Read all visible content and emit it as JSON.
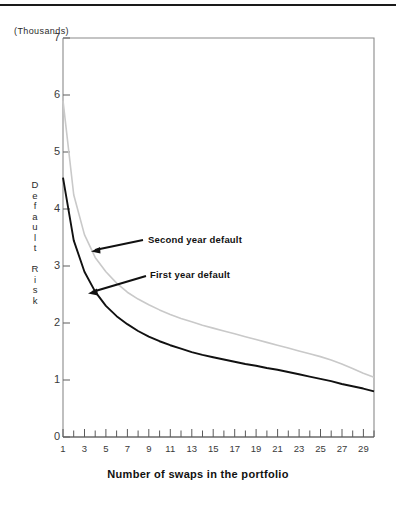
{
  "figure": {
    "units_note": "(Thousands)",
    "ylabel_text": "D\ne\nf\na\nu\nl\nt\n\nR\ni\ns\nk",
    "xlabel_text": "Number of swaps in the portfolio",
    "series_black_color": "#111111",
    "series_gray_color": "#c9c9c9",
    "frame_color": "#8a8a8a"
  },
  "annotations": {
    "second_year": "Second year default",
    "first_year": "First year default"
  },
  "axis": {
    "y_ticks": [
      "0",
      "1",
      "2",
      "3",
      "4",
      "5",
      "6",
      "7"
    ],
    "x_ticks": [
      "1",
      "3",
      "5",
      "7",
      "9",
      "11",
      "13",
      "15",
      "17",
      "19",
      "21",
      "23",
      "25",
      "27",
      "29"
    ]
  },
  "chart_data": {
    "type": "line",
    "title": "",
    "subtitle": "",
    "xlabel": "Number of swaps in the portfolio",
    "ylabel": "Default Risk",
    "units": "(Thousands)",
    "xlim": [
      1,
      30
    ],
    "ylim": [
      0,
      7
    ],
    "grid": false,
    "legend": "inline-annotations",
    "x": [
      1,
      2,
      3,
      4,
      5,
      6,
      7,
      8,
      9,
      10,
      11,
      12,
      13,
      14,
      15,
      16,
      17,
      18,
      19,
      20,
      21,
      22,
      23,
      24,
      25,
      26,
      27,
      28,
      29,
      30
    ],
    "series": [
      {
        "name": "First year default",
        "color": "#111111",
        "style": "solid",
        "values": [
          4.55,
          3.45,
          2.9,
          2.55,
          2.3,
          2.12,
          1.98,
          1.86,
          1.76,
          1.68,
          1.61,
          1.55,
          1.49,
          1.44,
          1.4,
          1.36,
          1.32,
          1.28,
          1.25,
          1.21,
          1.18,
          1.14,
          1.1,
          1.06,
          1.02,
          0.98,
          0.93,
          0.89,
          0.85,
          0.8
        ]
      },
      {
        "name": "Second year default",
        "color": "#c9c9c9",
        "style": "solid",
        "values": [
          5.9,
          4.25,
          3.55,
          3.15,
          2.9,
          2.7,
          2.54,
          2.42,
          2.32,
          2.23,
          2.15,
          2.08,
          2.02,
          1.96,
          1.91,
          1.86,
          1.81,
          1.76,
          1.71,
          1.66,
          1.61,
          1.56,
          1.51,
          1.46,
          1.41,
          1.35,
          1.28,
          1.2,
          1.12,
          1.05
        ]
      }
    ],
    "annotations": [
      {
        "text": "Second year default",
        "points_to_series": "Second year default",
        "x": 3.0,
        "y": 3.35
      },
      {
        "text": "First year default",
        "points_to_series": "First year default",
        "x": 3.3,
        "y": 2.62
      }
    ]
  }
}
